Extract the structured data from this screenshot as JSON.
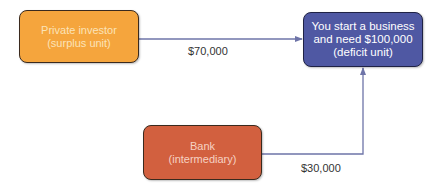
{
  "diagram": {
    "nodes": {
      "investor": {
        "line1": "Private investor",
        "line2": "(surplus unit)",
        "color": "#f5a53d"
      },
      "business": {
        "text": "You start a business and need $100,000 (deficit unit)",
        "color": "#4f58a3"
      },
      "bank": {
        "line1": "Bank",
        "line2": "(intermediary)",
        "color": "#d2603f"
      }
    },
    "edges": [
      {
        "from": "investor",
        "to": "business",
        "label": "$70,000"
      },
      {
        "from": "bank",
        "to": "business",
        "label": "$30,000"
      }
    ],
    "edge_color": "#6e74a8"
  }
}
